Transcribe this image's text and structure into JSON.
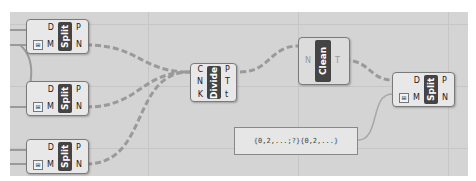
{
  "canvas": {
    "background": "#d4d4d4",
    "wire_color": "#9a9a9a"
  },
  "components": {
    "split1": {
      "name": "Split",
      "inputs": [
        "D",
        "M"
      ],
      "outputs": [
        "P",
        "N"
      ]
    },
    "split2": {
      "name": "Split",
      "inputs": [
        "D",
        "M"
      ],
      "outputs": [
        "P",
        "N"
      ]
    },
    "split3": {
      "name": "Split",
      "inputs": [
        "D",
        "M"
      ],
      "outputs": [
        "P",
        "N"
      ]
    },
    "divide": {
      "name": "Divide",
      "inputs": [
        "C",
        "N",
        "K"
      ],
      "outputs": [
        "P",
        "T",
        "t"
      ]
    },
    "clean": {
      "name": "Clean",
      "inputs": [
        "",
        "N",
        ""
      ],
      "outputs": [
        "T"
      ]
    },
    "split4": {
      "name": "Split",
      "inputs": [
        "D",
        "M"
      ],
      "outputs": [
        "P",
        "N"
      ]
    }
  },
  "panel": {
    "text": "{0,2,...;?}{0,2,...}"
  },
  "icons": {
    "mask_toggle": "⊞"
  }
}
